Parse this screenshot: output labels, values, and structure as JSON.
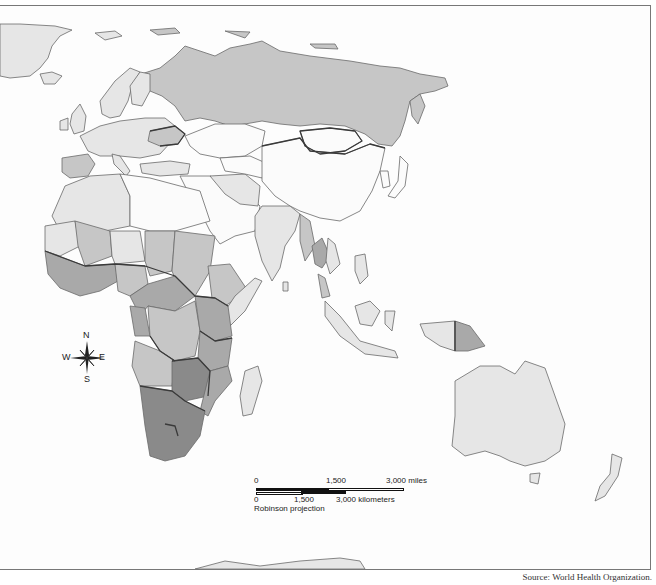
{
  "map": {
    "type": "choropleth",
    "projection": "Robinson projection",
    "region": "Africa, Europe, Asia, Oceania",
    "shading_scale": [
      "#fbfbfb",
      "#e6e6e6",
      "#c6c6c6",
      "#a9a9a9",
      "#8a8a8a"
    ],
    "shaded_regions": {
      "darkest": [
        "South Africa",
        "Namibia",
        "Botswana",
        "Zimbabwe",
        "Lesotho",
        "Swaziland",
        "Zambia",
        "Mozambique",
        "Malawi"
      ],
      "dark": [
        "Central African Republic",
        "Cameroon",
        "Gabon",
        "Congo",
        "Kenya",
        "Tanzania",
        "Uganda",
        "Côte d'Ivoire"
      ],
      "medium": [
        "Russia",
        "Ukraine",
        "Nigeria",
        "Sudan",
        "Chad",
        "Mali",
        "Ethiopia",
        "DR Congo",
        "Angola",
        "Thailand",
        "Cambodia",
        "Papua New Guinea"
      ],
      "light": [
        "Europe",
        "China",
        "India",
        "Australia",
        "Algeria",
        "Niger",
        "Mauritania",
        "Madagascar",
        "Myanmar",
        "Indonesia"
      ]
    }
  },
  "compass": {
    "n": "N",
    "s": "S",
    "e": "E",
    "w": "W"
  },
  "scale_bar": {
    "miles_labels": [
      "0",
      "1,500",
      "3,000 miles"
    ],
    "km_labels": [
      "0",
      "1,500",
      "3,000 kilometers"
    ],
    "projection_label": "Robinson projection"
  },
  "source": "Source: World Health Organization."
}
